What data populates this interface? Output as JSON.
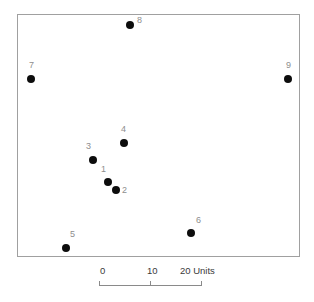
{
  "chart_data": {
    "type": "scatter",
    "title": "",
    "subtitle": "",
    "xlabel": "",
    "ylabel": "",
    "grid": false,
    "legend": "none",
    "axis_style": "scale-bar-only",
    "frame": {
      "left": 17,
      "top": 14,
      "width": 283,
      "height": 243
    },
    "scale_units": "Units",
    "scale_ticks": [
      "0",
      "10",
      "20"
    ],
    "scale_tick_px": [
      99,
      150,
      201
    ],
    "px_per_10_units": 51,
    "points": [
      {
        "label": "1",
        "px": 108,
        "py": 182,
        "x": 1.8,
        "y": 14.5,
        "label_dx": -7,
        "label_dy": -17
      },
      {
        "label": "2",
        "px": 116,
        "py": 190,
        "x": 3.3,
        "y": 12.9,
        "label_dx": 6,
        "label_dy": -4
      },
      {
        "label": "3",
        "px": 93,
        "py": 160,
        "x": -1.2,
        "y": 18.8,
        "label_dx": -7,
        "label_dy": -18
      },
      {
        "label": "4",
        "px": 124,
        "py": 143,
        "x": 4.9,
        "y": 22.1,
        "label_dx": -3,
        "label_dy": -18
      },
      {
        "label": "5",
        "px": 66,
        "py": 248,
        "x": -6.5,
        "y": 1.6,
        "label_dx": 4,
        "label_dy": -18
      },
      {
        "label": "6",
        "px": 191,
        "py": 233,
        "x": 18.0,
        "y": 4.6,
        "label_dx": 5,
        "label_dy": -17
      },
      {
        "label": "7",
        "px": 31,
        "py": 79,
        "x": -13.3,
        "y": 34.8,
        "label_dx": -2,
        "label_dy": -18
      },
      {
        "label": "8",
        "px": 130,
        "py": 25,
        "x": 6.1,
        "y": 45.4,
        "label_dx": 7,
        "label_dy": -9
      },
      {
        "label": "9",
        "px": 288,
        "py": 79,
        "x": 37.1,
        "y": 34.8,
        "label_dx": -2,
        "label_dy": -18
      }
    ]
  },
  "scalebar": {
    "labels": [
      {
        "text": "0",
        "px": 100
      },
      {
        "text": "10",
        "px": 147
      },
      {
        "text": "20 Units",
        "px": 180
      }
    ],
    "line": {
      "left": 99,
      "top": 285,
      "width": 102
    },
    "ticks": [
      {
        "px": 99,
        "top": 281,
        "height": 5
      },
      {
        "px": 150,
        "top": 281,
        "height": 5
      },
      {
        "px": 201,
        "top": 281,
        "height": 5
      }
    ]
  },
  "colors": {
    "marker": "#0d0d0d",
    "point_label": "#8e8e8e",
    "frame": "#a0a0a0",
    "scalebar": "#8a8a8a",
    "scale_label": "#3a3a3a",
    "background": "#ffffff"
  }
}
